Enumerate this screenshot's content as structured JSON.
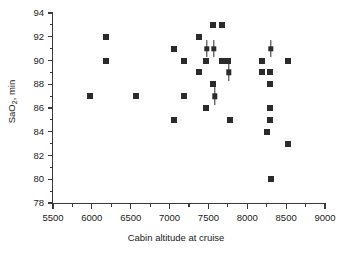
{
  "chart_data": {
    "type": "scatter",
    "title": "",
    "xlabel": "Cabin altitude at cruise",
    "ylabel": "SaO2, min",
    "ylabel_base": "SaO",
    "ylabel_sub": "2",
    "ylabel_tail": ", min",
    "xlim": [
      5500,
      9000
    ],
    "ylim": [
      78,
      94
    ],
    "xticks": [
      5500,
      6000,
      6500,
      7000,
      7500,
      8000,
      8500,
      9000
    ],
    "yticks": [
      78,
      80,
      82,
      84,
      86,
      88,
      90,
      92,
      94
    ],
    "xtick_labels": [
      "5500",
      "6000",
      "6500",
      "7000",
      "7500",
      "8000",
      "8500",
      "9000"
    ],
    "ytick_labels": [
      "78",
      "80",
      "82",
      "84",
      "86",
      "88",
      "90",
      "92",
      "94"
    ],
    "x_minor_interval": 250,
    "y_minor_interval": 1,
    "grid": false,
    "legend": null,
    "marker": "square",
    "marker_color": "#2b2b2b",
    "points": [
      {
        "x": 5970,
        "y": 87
      },
      {
        "x": 6180,
        "y": 92
      },
      {
        "x": 6180,
        "y": 90
      },
      {
        "x": 6570,
        "y": 87
      },
      {
        "x": 7060,
        "y": 91
      },
      {
        "x": 7060,
        "y": 85
      },
      {
        "x": 7180,
        "y": 90
      },
      {
        "x": 7180,
        "y": 87
      },
      {
        "x": 7380,
        "y": 92
      },
      {
        "x": 7380,
        "y": 89
      },
      {
        "x": 7470,
        "y": 90
      },
      {
        "x": 7470,
        "y": 86
      },
      {
        "x": 7560,
        "y": 93
      },
      {
        "x": 7560,
        "y": 88
      },
      {
        "x": 7680,
        "y": 93
      },
      {
        "x": 7680,
        "y": 90
      },
      {
        "x": 7750,
        "y": 90
      },
      {
        "x": 7780,
        "y": 85
      },
      {
        "x": 8190,
        "y": 90
      },
      {
        "x": 8190,
        "y": 89
      },
      {
        "x": 8260,
        "y": 84
      },
      {
        "x": 8290,
        "y": 89
      },
      {
        "x": 8290,
        "y": 88
      },
      {
        "x": 8290,
        "y": 86
      },
      {
        "x": 8290,
        "y": 85
      },
      {
        "x": 8300,
        "y": 80
      },
      {
        "x": 8530,
        "y": 90
      },
      {
        "x": 8530,
        "y": 83
      }
    ],
    "points_with_errorbars": [
      {
        "x": 7480,
        "y": 91,
        "yerr": 0.75
      },
      {
        "x": 7570,
        "y": 91,
        "yerr": 0.75
      },
      {
        "x": 7580,
        "y": 87,
        "yerr": 0.75
      },
      {
        "x": 7760,
        "y": 89,
        "yerr": 0.75
      },
      {
        "x": 8300,
        "y": 91,
        "yerr": 0.75
      }
    ]
  }
}
